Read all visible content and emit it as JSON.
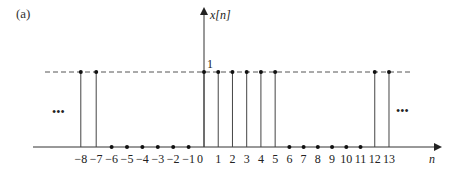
{
  "figure": {
    "panel_label": "(a)",
    "y_axis_label": "x[n]",
    "x_axis_label": "n",
    "level_label": "1",
    "continuation_left": "•••",
    "continuation_right": "•••"
  },
  "chart_data": {
    "type": "stem",
    "title": "(a)",
    "xlabel": "n",
    "ylabel": "x[n]",
    "x": [
      -8,
      -7,
      -6,
      -5,
      -4,
      -3,
      -2,
      -1,
      0,
      1,
      2,
      3,
      4,
      5,
      6,
      7,
      8,
      9,
      10,
      11,
      12,
      13
    ],
    "values": [
      1,
      1,
      0,
      0,
      0,
      0,
      0,
      0,
      1,
      1,
      1,
      1,
      1,
      1,
      0,
      0,
      0,
      0,
      0,
      0,
      1,
      1
    ],
    "tick_labels": [
      "−8",
      "−7",
      "−6",
      "−5",
      "−4",
      "−3",
      "−2",
      "−1",
      "0",
      "1",
      "2",
      "3",
      "4",
      "5",
      "6",
      "7",
      "8",
      "9",
      "10",
      "11",
      "12",
      "13"
    ],
    "reference_line": {
      "y": 1,
      "style": "dashed"
    },
    "periodic": true,
    "period": 12,
    "ylim": [
      0,
      1.5
    ],
    "grid": false,
    "legend": null
  }
}
